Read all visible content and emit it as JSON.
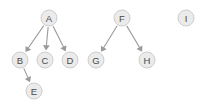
{
  "diagram": {
    "type": "directed-graph",
    "title": "",
    "background_color": "#ffffff",
    "node_fill_color": "#ebebeb",
    "node_stroke_color": "#c8c8c8",
    "node_label_color": "#4a4a4a",
    "edge_color": "#9a9a9a",
    "node_radius": 8,
    "nodes": [
      {
        "id": "A",
        "label": "A",
        "x": 49,
        "y": 18
      },
      {
        "id": "B",
        "label": "B",
        "x": 20,
        "y": 60
      },
      {
        "id": "C",
        "label": "C",
        "x": 45,
        "y": 60
      },
      {
        "id": "D",
        "label": "D",
        "x": 70,
        "y": 60
      },
      {
        "id": "E",
        "label": "E",
        "x": 34,
        "y": 91
      },
      {
        "id": "F",
        "label": "F",
        "x": 122,
        "y": 18
      },
      {
        "id": "G",
        "label": "G",
        "x": 96,
        "y": 60
      },
      {
        "id": "H",
        "label": "H",
        "x": 147,
        "y": 60
      },
      {
        "id": "I",
        "label": "I",
        "x": 186,
        "y": 18
      }
    ],
    "edges": [
      {
        "from": "A",
        "to": "B",
        "directed": true
      },
      {
        "from": "A",
        "to": "C",
        "directed": true
      },
      {
        "from": "A",
        "to": "D",
        "directed": true
      },
      {
        "from": "B",
        "to": "E",
        "directed": true
      },
      {
        "from": "F",
        "to": "G",
        "directed": true
      },
      {
        "from": "F",
        "to": "H",
        "directed": true
      }
    ],
    "isolated_nodes": [
      "I"
    ]
  }
}
